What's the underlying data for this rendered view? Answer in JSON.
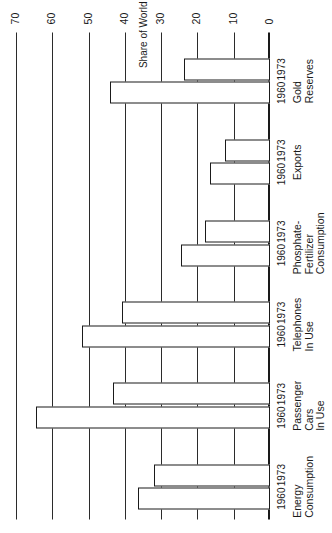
{
  "chart_data": {
    "type": "bar",
    "orientation": "horizontal-rotated",
    "title": "",
    "xlabel": "",
    "ylabel": "Share of World Totals (Percent)",
    "ylim": [
      0,
      70
    ],
    "ytick_labels": [
      "70",
      "60",
      "50",
      "40",
      "30",
      "20",
      "10",
      "0"
    ],
    "ytick_values": [
      70,
      60,
      50,
      40,
      30,
      20,
      10,
      0
    ],
    "grid": true,
    "legend": "none",
    "series_names": [
      "1960",
      "1973"
    ],
    "categories": [
      "Energy Consumption",
      "Passenger Cars In Use",
      "Telephones In Use",
      "Phosphate-Fertilizer Consumption",
      "Exports",
      "Gold Reserves"
    ],
    "category_lines": [
      [
        "Energy",
        "Consumption"
      ],
      [
        "Passenger",
        "Cars",
        "In Use"
      ],
      [
        "Telephones",
        "In Use"
      ],
      [
        "Phosphate-",
        "Fertilizer",
        "Consumption"
      ],
      [
        "Exports"
      ],
      [
        "Gold",
        "Reserves"
      ]
    ],
    "series": [
      {
        "name": "1960",
        "values": [
          36.5,
          64.5,
          51.8,
          24.5,
          16.5,
          44.0
        ]
      },
      {
        "name": "1973",
        "values": [
          32.0,
          43.3,
          40.8,
          18.0,
          12.4,
          23.7
        ]
      }
    ],
    "bars": [
      {
        "category": "Energy Consumption",
        "year": "1960",
        "value": 36.5
      },
      {
        "category": "Energy Consumption",
        "year": "1973",
        "value": 32.0
      },
      {
        "category": "Passenger Cars In Use",
        "year": "1960",
        "value": 64.5
      },
      {
        "category": "Passenger Cars In Use",
        "year": "1973",
        "value": 43.3
      },
      {
        "category": "Telephones In Use",
        "year": "1960",
        "value": 51.8
      },
      {
        "category": "Telephones In Use",
        "year": "1973",
        "value": 40.8
      },
      {
        "category": "Phosphate-Fertilizer Consumption",
        "year": "1960",
        "value": 24.5
      },
      {
        "category": "Phosphate-Fertilizer Consumption",
        "year": "1973",
        "value": 18.0
      },
      {
        "category": "Exports",
        "year": "1960",
        "value": 16.5
      },
      {
        "category": "Exports",
        "year": "1973",
        "value": 12.4
      },
      {
        "category": "Gold Reserves",
        "year": "1960",
        "value": 44.0
      },
      {
        "category": "Gold Reserves",
        "year": "1973",
        "value": 23.7
      }
    ],
    "colors": {
      "bar_fill": "#ffffff",
      "bar_stroke": "#1a1a1a",
      "grid": "#2b2b2b",
      "axis": "#1a1a1a",
      "text": "#1a1a1a",
      "background": "#ffffff"
    }
  }
}
